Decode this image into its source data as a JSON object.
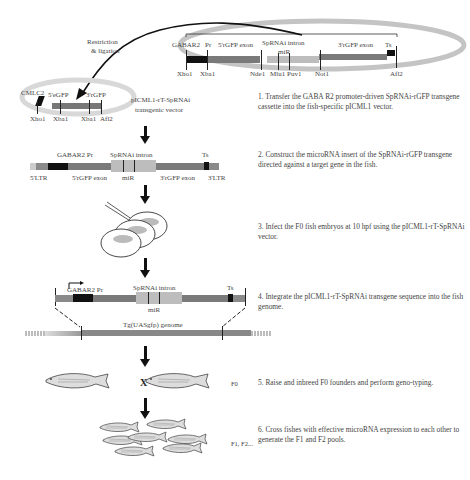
{
  "top_plasmid": {
    "labels": {
      "gabar2": "GABAR2",
      "pr": "Pr",
      "five_exon": "5'rGFP exon",
      "intron": "SpRNAi intron",
      "mir": "miR",
      "three_exon": "3'rGFP exon",
      "ts": "Ts"
    },
    "sites": [
      "Xho1",
      "Xba1",
      "Nde1",
      "Mlu1",
      "Puv1",
      "Not1",
      "Afl2"
    ]
  },
  "restriction_label": [
    "Restriction",
    "& ligation"
  ],
  "vector": {
    "labels": {
      "cmlc2": "CMLC2",
      "five": "5'eGFP",
      "three": "3'rGFP"
    },
    "sites": [
      "Xho1",
      "Xba1",
      "Xba1",
      "Afl2"
    ],
    "name": [
      "pICML1-rT-SpRNAi",
      "transgenic vector"
    ]
  },
  "insert": {
    "labels": {
      "gabar2": "GABAR2 Pr",
      "intron": "SpRNAi intron",
      "ts": "Ts",
      "ltr5": "5'LTR",
      "five_exon": "5'rGFP exon",
      "mir": "miR",
      "three_exon": "3'rGFP exon",
      "ltr3": "3'LTR"
    }
  },
  "integration": {
    "labels": {
      "gabar2": "GABAR2 Pr",
      "intron": "SpRNAi intron",
      "ts": "Ts",
      "mir": "miR",
      "genome": "Tg(UASgfp) genome"
    }
  },
  "cross": {
    "cross_symbol": "X",
    "f0_label": "F0",
    "f1f2_label": "F1, F2..."
  },
  "steps": [
    {
      "num": "1.",
      "text": "Transfer the GABA R2 promoter-driven SpRNAi-rGFP transgene cassette into the fish-specific pICML1 vector."
    },
    {
      "num": "2.",
      "text": "Construct the microRNA insert of the SpRNAi-rGFP transgene directed against a target gene in the fish."
    },
    {
      "num": "3.",
      "text": "Infect the F0 fish embryos at 10 hpf using the pICML1-rT-SpRNAi vector."
    },
    {
      "num": "4.",
      "text": "Integrate the pICML1-rT-SpRNAi transgene sequence into the fish genome."
    },
    {
      "num": "5.",
      "text": "Raise and inbreed F0 founders and perform geno-typing."
    },
    {
      "num": "6.",
      "text": "Cross fishes with effective microRNA expression to each other to generate the F1 and F2 pools."
    }
  ],
  "colors": {
    "ring": "#c8c8c8",
    "dark": "#111111",
    "exon": "#7a7a7a",
    "intron": "#bdbdbd",
    "light": "#d6d6d6"
  }
}
